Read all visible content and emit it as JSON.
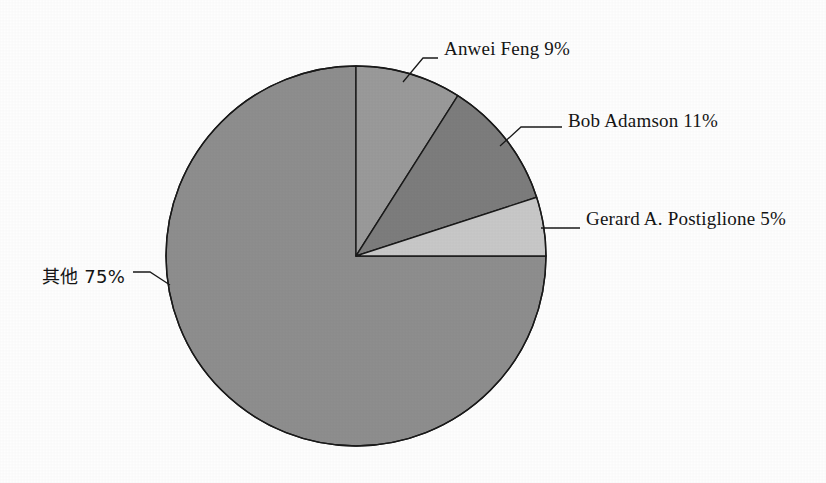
{
  "chart_data": {
    "type": "pie",
    "title": "",
    "subtitle": "",
    "xlabel": "",
    "ylabel": "",
    "legend_position": "none",
    "grid": false,
    "labels_show_percent": true,
    "start_angle_deg": 0,
    "direction": "clockwise",
    "categories": [
      "Anwei Feng",
      "Bob Adamson",
      "Gerard A.  Postiglione",
      "其他"
    ],
    "values": [
      9,
      11,
      5,
      75
    ],
    "unit": "%",
    "slices": [
      {
        "name": "Anwei Feng",
        "label": "Anwei Feng  9%",
        "value": 9,
        "percent": "9%",
        "color": "#9a9a9a",
        "label_x": 444,
        "label_y": 38
      },
      {
        "name": "Bob Adamson",
        "label": "Bob Adamson  11%",
        "value": 11,
        "percent": "11%",
        "color": "#7d7d7d",
        "label_x": 568,
        "label_y": 110
      },
      {
        "name": "Gerard A.  Postiglione",
        "label": "Gerard A.  Postiglione 5%",
        "value": 5,
        "percent": "5%",
        "color": "#c8c8c8",
        "label_x": 586,
        "label_y": 208
      },
      {
        "name": "其他",
        "label": "其他 75%",
        "value": 75,
        "percent": "75%",
        "color": "#8e8e8e",
        "label_x": 42,
        "label_y": 262
      }
    ],
    "geometry": {
      "center_x": 356,
      "center_y": 256,
      "radius": 190,
      "stroke_color": "#1a1a1a",
      "stroke_width": 1.4,
      "background": "#ffffff"
    }
  }
}
